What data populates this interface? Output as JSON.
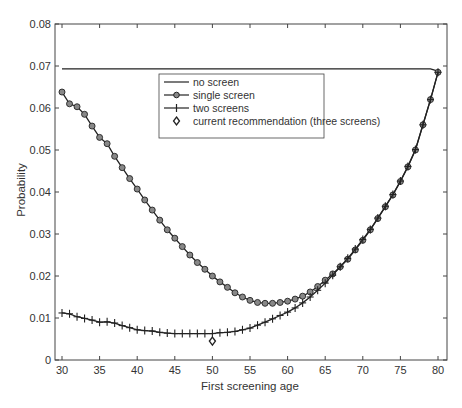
{
  "chart_data": {
    "type": "line",
    "title": "",
    "xlabel": "First screening age",
    "ylabel": "Probability",
    "xlim": [
      29,
      81
    ],
    "ylim": [
      0,
      0.08
    ],
    "xticks": [
      30,
      35,
      40,
      45,
      50,
      55,
      60,
      65,
      70,
      75,
      80
    ],
    "yticks": [
      0,
      0.01,
      0.02,
      0.03,
      0.04,
      0.05,
      0.06,
      0.07,
      0.08
    ],
    "ytick_labels": [
      "0",
      "0.01",
      "0.02",
      "0.03",
      "0.04",
      "0.05",
      "0.06",
      "0.07",
      "0.08"
    ],
    "grid": false,
    "legend_position": "upper center",
    "x": [
      30,
      31,
      32,
      33,
      34,
      35,
      36,
      37,
      38,
      39,
      40,
      41,
      42,
      43,
      44,
      45,
      46,
      47,
      48,
      49,
      50,
      51,
      52,
      53,
      54,
      55,
      56,
      57,
      58,
      59,
      60,
      61,
      62,
      63,
      64,
      65,
      66,
      67,
      68,
      69,
      70,
      71,
      72,
      73,
      74,
      75,
      76,
      77,
      78,
      79,
      80
    ],
    "series": [
      {
        "name": "no screen",
        "marker": "none",
        "values": [
          0.0693,
          0.0693,
          0.0693,
          0.0693,
          0.0693,
          0.0693,
          0.0693,
          0.0693,
          0.0693,
          0.0693,
          0.0693,
          0.0693,
          0.0693,
          0.0693,
          0.0693,
          0.0693,
          0.0693,
          0.0693,
          0.0693,
          0.0693,
          0.0693,
          0.0693,
          0.0693,
          0.0693,
          0.0693,
          0.0693,
          0.0693,
          0.0693,
          0.0693,
          0.0693,
          0.0693,
          0.0693,
          0.0693,
          0.0693,
          0.0693,
          0.0693,
          0.0693,
          0.0693,
          0.0693,
          0.0693,
          0.0693,
          0.0693,
          0.0693,
          0.0693,
          0.0693,
          0.0693,
          0.0693,
          0.0693,
          0.0693,
          0.0693,
          0.0688
        ]
      },
      {
        "name": "single screen",
        "marker": "circle",
        "values": [
          0.0638,
          0.061,
          0.0603,
          0.0585,
          0.0557,
          0.053,
          0.0515,
          0.0485,
          0.0458,
          0.0432,
          0.0407,
          0.0381,
          0.0357,
          0.0333,
          0.031,
          0.029,
          0.027,
          0.025,
          0.0232,
          0.0216,
          0.02,
          0.0186,
          0.0173,
          0.016,
          0.015,
          0.0142,
          0.0137,
          0.0135,
          0.0135,
          0.0137,
          0.014,
          0.0145,
          0.0152,
          0.0162,
          0.0175,
          0.019,
          0.0205,
          0.0222,
          0.024,
          0.0262,
          0.0285,
          0.031,
          0.0337,
          0.0365,
          0.0393,
          0.0425,
          0.046,
          0.05,
          0.056,
          0.062,
          0.0685
        ]
      },
      {
        "name": "two screens",
        "marker": "plus",
        "values": [
          0.0112,
          0.011,
          0.0103,
          0.0099,
          0.0095,
          0.009,
          0.0091,
          0.0088,
          0.0082,
          0.0077,
          0.0072,
          0.007,
          0.0069,
          0.0066,
          0.0064,
          0.0063,
          0.0063,
          0.0063,
          0.0063,
          0.0063,
          0.0063,
          0.0065,
          0.0066,
          0.0068,
          0.0072,
          0.0076,
          0.0083,
          0.009,
          0.0098,
          0.0106,
          0.0114,
          0.0124,
          0.0136,
          0.015,
          0.0166,
          0.0183,
          0.0202,
          0.0222,
          0.0242,
          0.0264,
          0.0287,
          0.0311,
          0.0338,
          0.0366,
          0.0394,
          0.0426,
          0.0461,
          0.0501,
          0.056,
          0.062,
          0.0685
        ]
      },
      {
        "name": "current recommendation (three screens)",
        "marker": "diamond",
        "points": [
          {
            "x": 50,
            "y": 0.0045
          }
        ]
      }
    ]
  },
  "legend": {
    "items": [
      {
        "label": "no screen",
        "marker": "line"
      },
      {
        "label": "single screen",
        "marker": "circle-line"
      },
      {
        "label": "two screens",
        "marker": "plus-line"
      },
      {
        "label": "current recommendation (three screens)",
        "marker": "diamond"
      }
    ]
  },
  "colors": {
    "line": "#222222",
    "axis": "#333333",
    "marker_fill": "#888888"
  }
}
